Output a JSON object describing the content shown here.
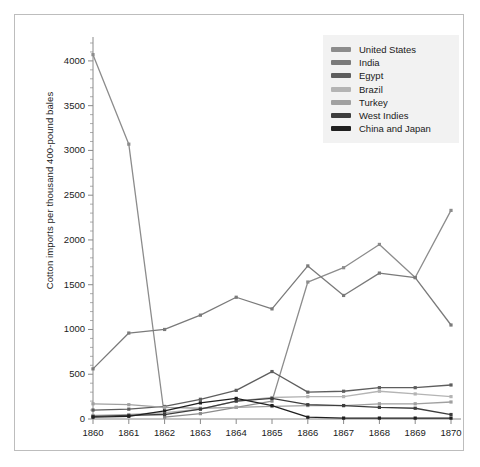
{
  "figure": {
    "frame_border_color": "#bdbdbd",
    "background": "#ffffff"
  },
  "legend": {
    "position": "top-right",
    "background": "#f2f2f2",
    "entries": [
      {
        "label": "United States",
        "color": "#8c8c8c"
      },
      {
        "label": "India",
        "color": "#7a7a7a"
      },
      {
        "label": "Egypt",
        "color": "#5e5e5e"
      },
      {
        "label": "Brazil",
        "color": "#b4b4b4"
      },
      {
        "label": "Turkey",
        "color": "#a0a0a0"
      },
      {
        "label": "West Indies",
        "color": "#3d3d3d"
      },
      {
        "label": "China and Japan",
        "color": "#1f1f1f"
      }
    ]
  },
  "chart_data": {
    "type": "line",
    "title": "",
    "xlabel": "",
    "ylabel": "Cotton imports per thousand 400-pound bales",
    "x": [
      1860,
      1861,
      1862,
      1863,
      1864,
      1865,
      1866,
      1867,
      1868,
      1869,
      1870
    ],
    "xtick_labels": [
      "1860",
      "1861",
      "1862",
      "1863",
      "1864",
      "1865",
      "1866",
      "1867",
      "1868",
      "1869",
      "1870"
    ],
    "ytick_labels": [
      "0",
      "500",
      "1000",
      "1500",
      "2000",
      "2500",
      "3000",
      "3500",
      "4000"
    ],
    "yticks": [
      0,
      500,
      1000,
      1500,
      2000,
      2500,
      3000,
      3500,
      4000
    ],
    "ylim": [
      0,
      4200
    ],
    "xlim": [
      1860,
      1870
    ],
    "grid": false,
    "markers": true,
    "series": [
      {
        "name": "United States",
        "color": "#8c8c8c",
        "values": [
          4070,
          3070,
          20,
          60,
          130,
          200,
          1530,
          1690,
          1950,
          1580,
          2330
        ]
      },
      {
        "name": "India",
        "color": "#7a7a7a",
        "values": [
          560,
          960,
          1000,
          1160,
          1360,
          1230,
          1710,
          1380,
          1630,
          1580,
          1050
        ]
      },
      {
        "name": "Egypt",
        "color": "#5e5e5e",
        "values": [
          100,
          110,
          140,
          220,
          320,
          530,
          300,
          310,
          350,
          350,
          380
        ]
      },
      {
        "name": "Brazil",
        "color": "#b4b4b4",
        "values": [
          40,
          50,
          70,
          110,
          200,
          240,
          250,
          250,
          310,
          280,
          250
        ]
      },
      {
        "name": "Turkey",
        "color": "#a0a0a0",
        "values": [
          170,
          160,
          130,
          120,
          130,
          140,
          150,
          150,
          170,
          170,
          190
        ]
      },
      {
        "name": "West Indies",
        "color": "#3d3d3d",
        "values": [
          30,
          40,
          50,
          110,
          200,
          230,
          160,
          150,
          130,
          120,
          50
        ]
      },
      {
        "name": "China and Japan",
        "color": "#1f1f1f",
        "values": [
          20,
          30,
          90,
          180,
          230,
          150,
          20,
          10,
          10,
          10,
          10
        ]
      }
    ]
  }
}
